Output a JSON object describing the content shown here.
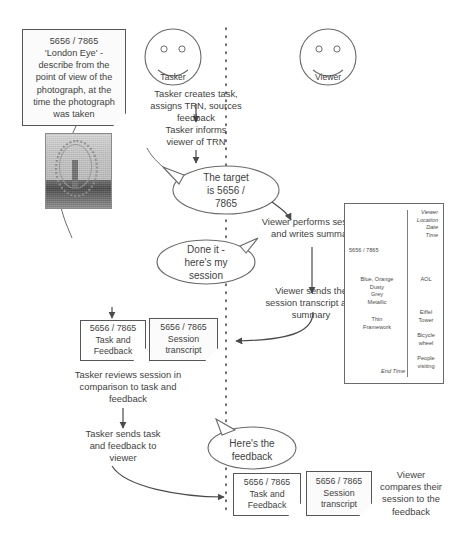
{
  "diagram": {
    "actors": [
      {
        "id": "tasker",
        "label": "Tasker"
      },
      {
        "id": "viewer",
        "label": "Viewer"
      }
    ],
    "task_note": {
      "trn": "5656 / 7865",
      "body": "5656 / 7865\n'London Eye' -\ndescribe from the\npoint of view of the\nphotograph, at the\ntime the photograph\nwas taken"
    },
    "photo": {
      "caption": "London Eye photograph",
      "alt": "grayscale photograph of the London Eye ferris wheel"
    },
    "steps": [
      {
        "id": "step-1",
        "text": "Tasker creates task,\nassigns TRN, sources\nfeedback"
      },
      {
        "id": "step-2",
        "text": "Tasker informs\nviewer of TRN"
      },
      {
        "id": "step-3",
        "text": "Viewer performs session\nand writes summary"
      },
      {
        "id": "step-4",
        "text": "Viewer sends the\nsession transcript and\nsummary"
      },
      {
        "id": "step-5",
        "text": "Tasker reviews session in\ncomparison to task and\nfeedback"
      },
      {
        "id": "step-6",
        "text": "Tasker sends task\nand feedback to\nviewer"
      },
      {
        "id": "step-7",
        "text": "Viewer\ncompares their\nsession to the\nfeedback"
      }
    ],
    "speech_bubbles": [
      {
        "id": "bubble-target",
        "speaker": "tasker",
        "text": "The target\nis 5656 /\n7865"
      },
      {
        "id": "bubble-done",
        "speaker": "viewer",
        "text": "Done it -\nhere's my\nsession"
      },
      {
        "id": "bubble-feedback",
        "speaker": "tasker",
        "text": "Here's the\nfeedback"
      }
    ],
    "documents": [
      {
        "id": "doc-task-feedback-1",
        "text": "5656 / 7865\nTask and\nFeedback"
      },
      {
        "id": "doc-session-transcript-1",
        "text": "5656 / 7865\nSession\ntranscript"
      },
      {
        "id": "doc-task-feedback-2",
        "text": "5656 / 7865\nTask and\nFeedback"
      },
      {
        "id": "doc-session-transcript-2",
        "text": "5656 / 7865\nSession\ntranscript"
      }
    ],
    "transcript_panel": {
      "header_fields": "Viewer\nLocation\nDate\nTime",
      "trn": "5656 / 7865",
      "descriptors": "Blue, Orange\nDusty\nGrey\nMetallic",
      "structure": "Thin\nFramework",
      "end_time": "End Time",
      "right_notes": [
        {
          "id": "note-aol",
          "text": "AOL"
        },
        {
          "id": "note-eiffel",
          "text": "Eiffel\nTower"
        },
        {
          "id": "note-bicycle",
          "text": "Bicycle\nwheel"
        },
        {
          "id": "note-people",
          "text": "People\nvisiting"
        }
      ]
    },
    "colors": {
      "ink": "#3f3f3f",
      "stroke": "#565656",
      "paper": "#ffffff",
      "note_fill": "#fbfbfb"
    }
  }
}
